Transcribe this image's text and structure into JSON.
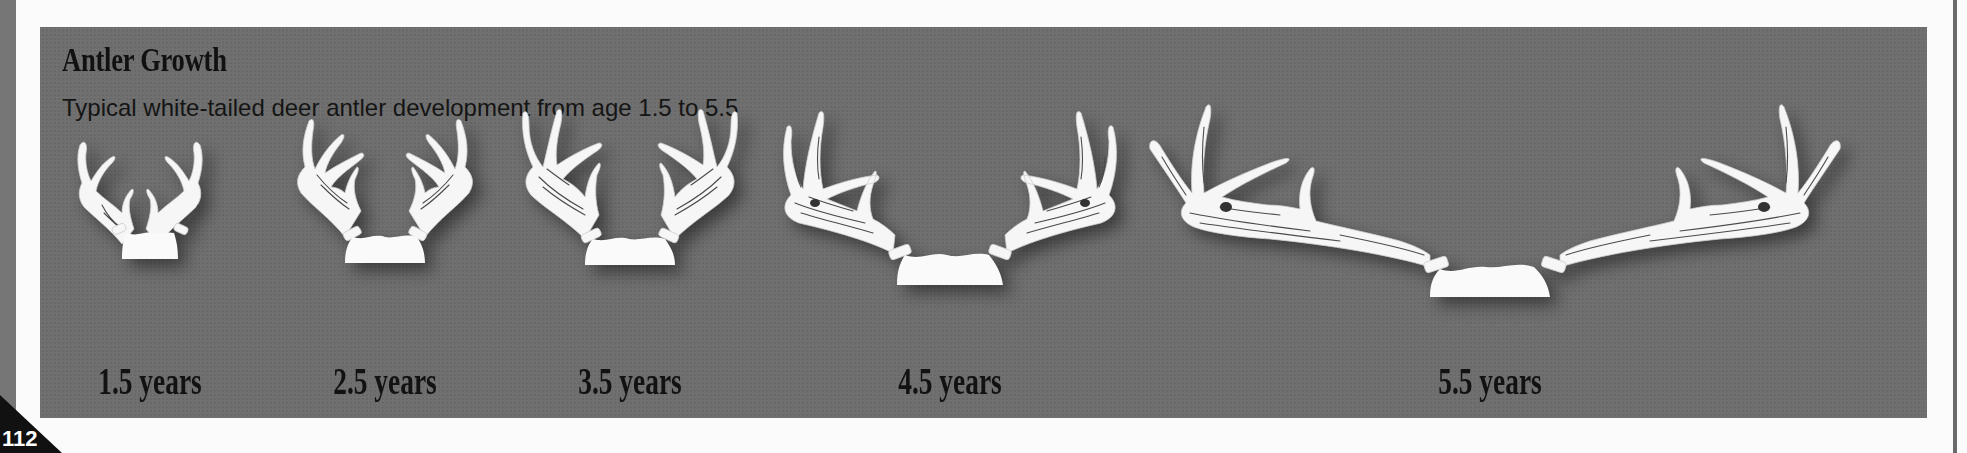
{
  "page": {
    "number": "112",
    "colors": {
      "panel_bg": "#6f6f6f",
      "antler": "#f6f6f6",
      "text": "#111111",
      "page_tab": "#111111"
    }
  },
  "figure": {
    "title": "Antler Growth",
    "subtitle": "Typical white-tailed deer antler development from age 1.5 to 5.5",
    "stages": [
      {
        "label": "1.5 years",
        "icon": "antler-rack-1-5-icon"
      },
      {
        "label": "2.5 years",
        "icon": "antler-rack-2-5-icon"
      },
      {
        "label": "3.5 years",
        "icon": "antler-rack-3-5-icon"
      },
      {
        "label": "4.5 years",
        "icon": "antler-rack-4-5-icon"
      },
      {
        "label": "5.5 years",
        "icon": "antler-rack-5-5-icon"
      }
    ]
  }
}
